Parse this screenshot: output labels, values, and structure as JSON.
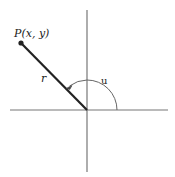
{
  "diagram": {
    "type": "polar-coordinates",
    "point_label": "P(x, y)",
    "radius_label": "r",
    "angle_label": "u",
    "colors": {
      "axis": "#777777",
      "segment": "#222222",
      "arc": "#666666",
      "text": "#222222"
    },
    "geometry": {
      "origin": [
        87,
        110
      ],
      "point": [
        21,
        43
      ],
      "x_axis": [
        10,
        168
      ],
      "y_axis": [
        10,
        172
      ],
      "arc_radius": 30
    }
  }
}
